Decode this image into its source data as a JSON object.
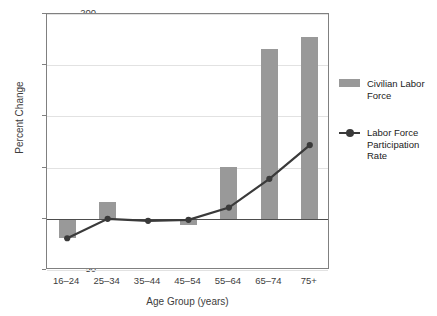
{
  "chart_data": {
    "type": "bar",
    "title": "",
    "subtitle": "",
    "xlabel": "Age Group (years)",
    "ylabel": "Percent Change",
    "categories": [
      "16–24",
      "25–34",
      "35–44",
      "45–54",
      "55–64",
      "65–74",
      "75+"
    ],
    "series": [
      {
        "name": "Civilian Labor Force",
        "type": "bar",
        "color": "#999999",
        "values": [
          -19,
          16,
          0,
          -6,
          51,
          166,
          178
        ]
      },
      {
        "name": "Labor Force Participation Rate",
        "type": "line",
        "color": "#3a3a3a",
        "marker": "circle",
        "values": [
          -19,
          0,
          -2,
          -1,
          11,
          39,
          72
        ]
      }
    ],
    "ylim": [
      -50,
      200
    ],
    "yticks": [
      -50,
      0,
      50,
      100,
      150,
      200
    ],
    "ytick_labels": [
      "−50",
      "0",
      "50",
      "100",
      "150",
      "200"
    ],
    "grid": true,
    "grid_axis": "y",
    "legend_position": "right",
    "zero_line": true
  },
  "legend": {
    "entries": [
      {
        "label": "Civilian Labor Force",
        "swatch": "bar-swatch-icon"
      },
      {
        "label": "Labor Force Participation Rate",
        "swatch": "line-marker-icon"
      }
    ]
  }
}
